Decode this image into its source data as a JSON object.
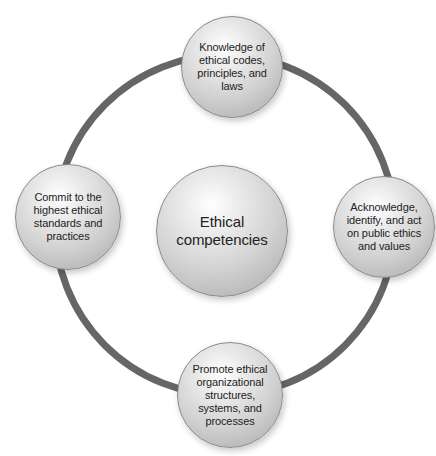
{
  "diagram": {
    "type": "cycle",
    "ring_color": "#666666",
    "center": {
      "label": "Ethical competencies",
      "line1": "Ethical",
      "line2": "competencies"
    },
    "nodes": [
      {
        "position": "top",
        "lines": [
          "Knowledge of",
          "ethical codes,",
          "principles, and",
          "laws"
        ]
      },
      {
        "position": "right",
        "lines": [
          "Acknowledge,",
          "identify, and act",
          "on public ethics",
          "and values"
        ]
      },
      {
        "position": "bottom",
        "lines": [
          "Promote ethical",
          "organizational",
          "structures,",
          "systems, and",
          "processes"
        ]
      },
      {
        "position": "left",
        "lines": [
          "Commit to the",
          "highest ethical",
          "standards and",
          "practices"
        ]
      }
    ]
  }
}
